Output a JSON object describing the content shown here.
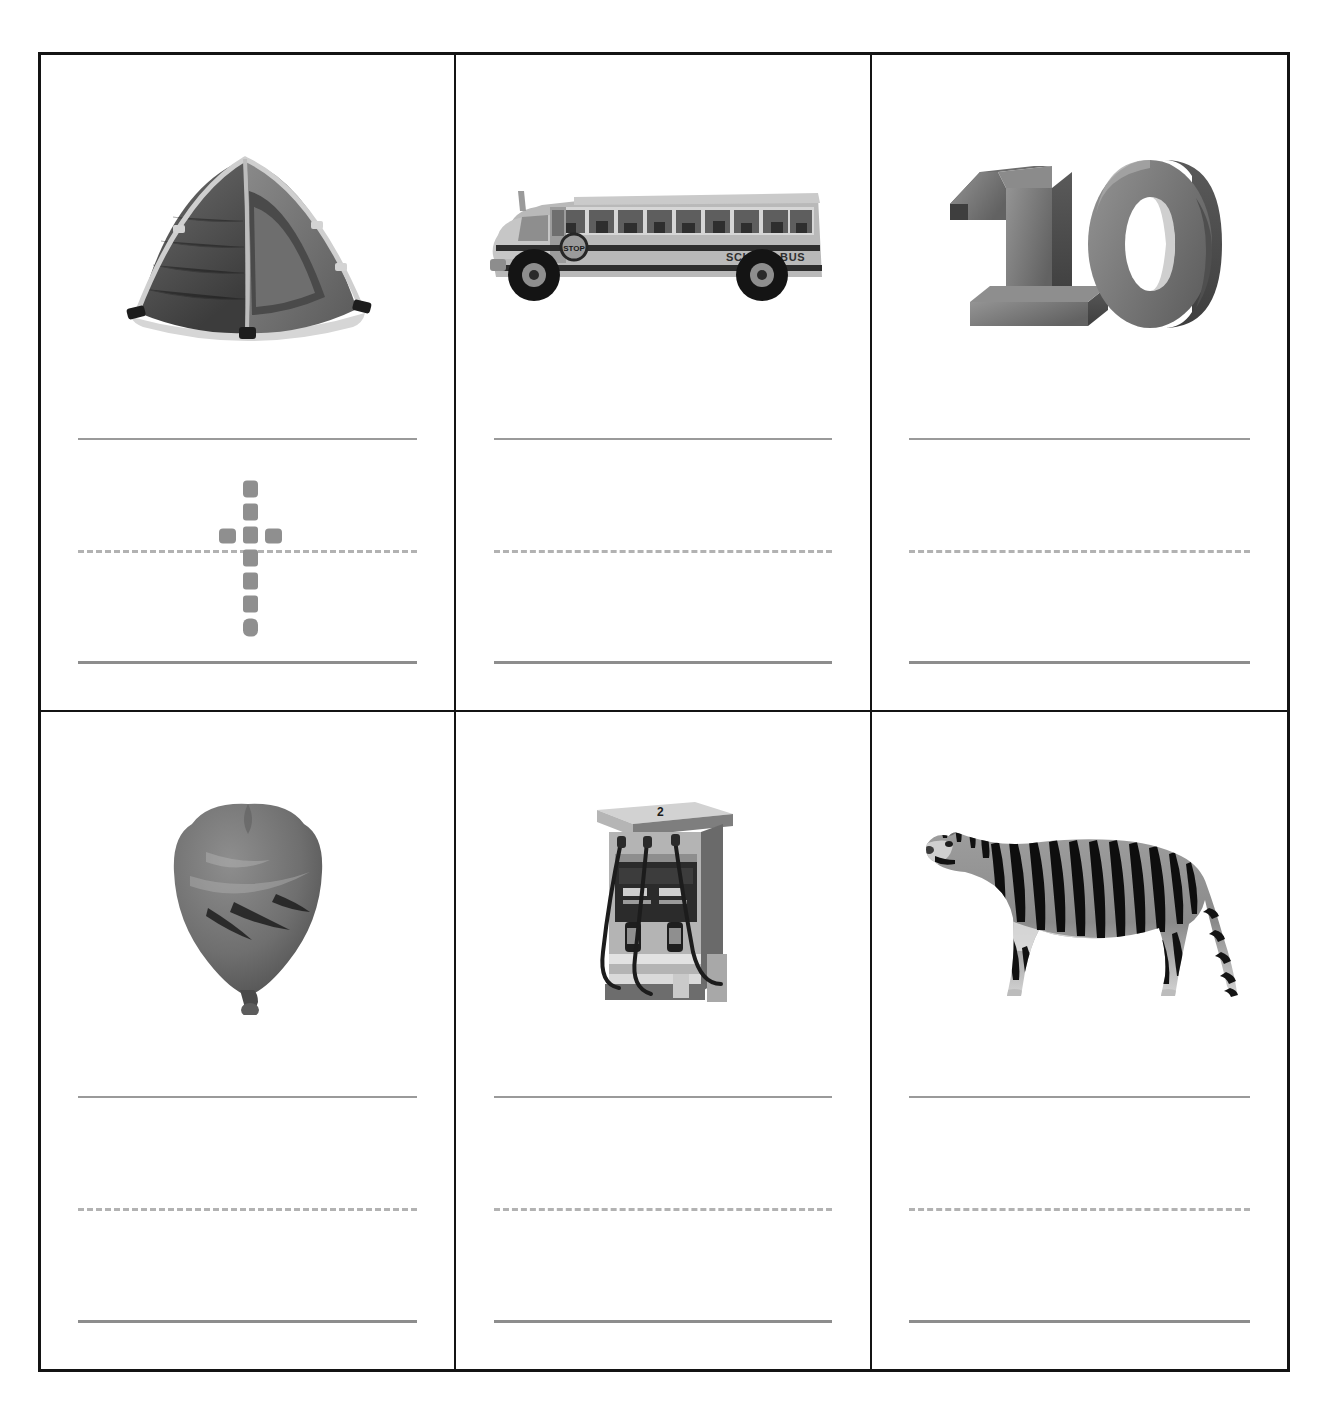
{
  "worksheet": {
    "title": "Handwriting tracing worksheet",
    "layout": {
      "columns": 3,
      "rows": 2,
      "cell_count": 6
    },
    "line_guide": {
      "top_line_style": "solid",
      "middle_line_style": "dashed",
      "baseline_style": "solid",
      "top_line_color": "#9a9a9a",
      "middle_line_color": "#b2b2b2",
      "baseline_color": "#8d8d8d"
    },
    "frame_color": "#141414",
    "background_color": "#ffffff",
    "trace_color": "#8f8f8f"
  },
  "cells": [
    {
      "index": 1,
      "position": "row1-col1",
      "picture_name": "tent-image",
      "picture_label": "tent",
      "picture_description": "grayscale dome camping tent",
      "has_trace_letter": true,
      "trace_letter": "t",
      "trace_name": "dotted-letter-t"
    },
    {
      "index": 2,
      "position": "row1-col2",
      "picture_name": "school-bus-image",
      "picture_label": "school bus",
      "picture_description": "grayscale school bus, side view",
      "picture_text": "SCHOOL BUS",
      "picture_sign_text": "STOP",
      "has_trace_letter": false,
      "trace_letter": ""
    },
    {
      "index": 3,
      "position": "row1-col3",
      "picture_name": "number-ten-image",
      "picture_label": "ten",
      "picture_description": "three-dimensional extruded grey numeral",
      "picture_text": "10",
      "has_trace_letter": false,
      "trace_letter": ""
    },
    {
      "index": 4,
      "position": "row2-col1",
      "picture_name": "balloon-image",
      "picture_label": "balloon",
      "picture_description": "grayscale inflated balloon with knot",
      "has_trace_letter": false,
      "trace_letter": ""
    },
    {
      "index": 5,
      "position": "row2-col2",
      "picture_name": "gas-pump-image",
      "picture_label": "gas pump",
      "picture_description": "grayscale fuel dispenser with hoses",
      "picture_text": "2",
      "has_trace_letter": false,
      "trace_letter": ""
    },
    {
      "index": 6,
      "position": "row2-col3",
      "picture_name": "tiger-image",
      "picture_label": "tiger",
      "picture_description": "grayscale striped tiger standing, side view",
      "has_trace_letter": false,
      "trace_letter": ""
    }
  ]
}
